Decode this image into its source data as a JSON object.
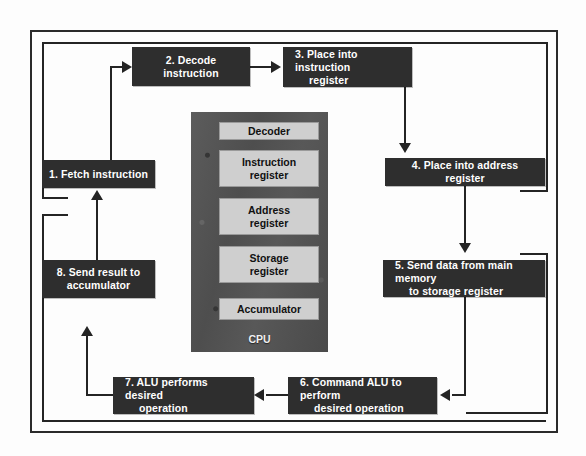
{
  "diagram": {
    "frame_color": "#2b2b2b",
    "box_fill": "#2e2e2e",
    "box_text_color": "#ffffff",
    "register_fill": "#cfcfcf",
    "cpu_fill": "#555555",
    "line_color": "#242424",
    "steps": [
      {
        "id": "step-1",
        "number": "1.",
        "label": "1. Fetch instruction"
      },
      {
        "id": "step-2",
        "number": "2.",
        "label": "2. Decode instruction"
      },
      {
        "id": "step-3",
        "number": "3.",
        "line1": "3. Place into instruction",
        "line2": "register"
      },
      {
        "id": "step-4",
        "number": "4.",
        "label": "4. Place into address register"
      },
      {
        "id": "step-5",
        "number": "5.",
        "line1": "5. Send data from main memory",
        "line2": "to storage register"
      },
      {
        "id": "step-6",
        "number": "6.",
        "line1": "6. Command ALU to perform",
        "line2": "desired operation"
      },
      {
        "id": "step-7",
        "number": "7.",
        "line1": "7. ALU performs desired",
        "line2": "operation"
      },
      {
        "id": "step-8",
        "number": "8.",
        "line1": "8. Send result to",
        "line2": "accumulator"
      }
    ],
    "cpu": {
      "label": "CPU",
      "registers": [
        {
          "id": "decoder",
          "label": "Decoder"
        },
        {
          "id": "instruction-register",
          "line1": "Instruction",
          "line2": "register"
        },
        {
          "id": "address-register",
          "line1": "Address",
          "line2": "register"
        },
        {
          "id": "storage-register",
          "line1": "Storage",
          "line2": "register"
        },
        {
          "id": "accumulator",
          "label": "Accumulator"
        }
      ]
    }
  }
}
